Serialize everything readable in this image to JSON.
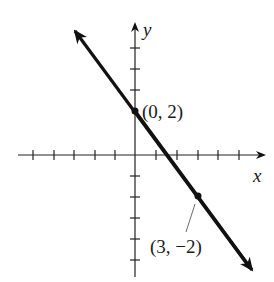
{
  "graph": {
    "axes": {
      "x_label": "x",
      "y_label": "y",
      "x_ticks": [
        -5,
        -4,
        -3,
        -2,
        -1,
        1,
        2,
        3,
        4,
        5
      ],
      "y_ticks": [
        -5,
        -4,
        -3,
        -2,
        -1,
        1,
        2,
        3
      ]
    },
    "line": {
      "slope": -1.3333,
      "intercept": 2,
      "color": "#111111"
    },
    "points": [
      {
        "x": 0,
        "y": 2,
        "label": "(0, 2)"
      },
      {
        "x": 3,
        "y": -2,
        "label": "(3, −2)"
      }
    ]
  }
}
